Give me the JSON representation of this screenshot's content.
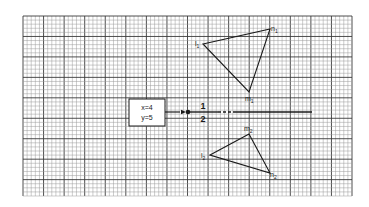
{
  "figure": {
    "grid": {
      "x0": 23,
      "y0": 16,
      "x1": 352,
      "y1": 196,
      "minor_step": 4.11,
      "major_every": 5,
      "minor_color": "#9a9a9a",
      "major_color": "#3a3a3a"
    },
    "box": {
      "x": 129,
      "y": 99,
      "w": 36,
      "h": 27,
      "line1": "x=4",
      "line2": "y=5"
    },
    "divider": {
      "y": 112,
      "arrow_start_x": 174,
      "dot_x": 188,
      "end_x": 312,
      "label_above": "1",
      "label_below": "2",
      "label_x": 203
    },
    "triangle1": {
      "vertices": {
        "l": {
          "x": 203,
          "y": 44,
          "label": "l",
          "sub": "1"
        },
        "n": {
          "x": 270,
          "y": 29,
          "label": "n",
          "sub": "1"
        },
        "m": {
          "x": 249,
          "y": 92,
          "label": "m",
          "sub": "1"
        }
      }
    },
    "triangle2": {
      "vertices": {
        "l": {
          "x": 210,
          "y": 155,
          "label": "l",
          "sub": "2"
        },
        "m": {
          "x": 249,
          "y": 134,
          "label": "m",
          "sub": "2"
        },
        "n": {
          "x": 270,
          "y": 173,
          "label": "n",
          "sub": "2"
        }
      }
    },
    "stroke_color": "#1a1a1a"
  }
}
